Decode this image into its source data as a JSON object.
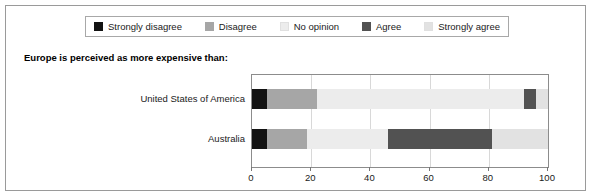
{
  "chart_data": {
    "type": "bar",
    "orientation": "horizontal",
    "stacked": true,
    "title": "Europe is perceived as more expensive than:",
    "xlabel": "",
    "ylabel": "",
    "xlim": [
      0,
      100
    ],
    "xticks": [
      0,
      20,
      40,
      60,
      80,
      100
    ],
    "grid": true,
    "legend_position": "top",
    "categories": [
      "United States of America",
      "Australia"
    ],
    "series": [
      {
        "name": "Strongly disagree",
        "color": "#121212",
        "values": [
          5,
          5
        ]
      },
      {
        "name": "Disagree",
        "color": "#a6a6a6",
        "values": [
          17,
          13.5
        ]
      },
      {
        "name": "No opinion",
        "color": "#ececec",
        "values": [
          70,
          27.5
        ]
      },
      {
        "name": "Agree",
        "color": "#525252",
        "values": [
          4,
          35
        ]
      },
      {
        "name": "Strongly agree",
        "color": "#e2e2e2",
        "values": [
          4,
          19
        ]
      }
    ]
  },
  "legend": {
    "items": [
      {
        "label": "Strongly disagree"
      },
      {
        "label": "Disagree"
      },
      {
        "label": "No opinion"
      },
      {
        "label": "Agree"
      },
      {
        "label": "Strongly agree"
      }
    ]
  },
  "axis": {
    "ticks": [
      {
        "label": "0",
        "value": 0
      },
      {
        "label": "20",
        "value": 20
      },
      {
        "label": "40",
        "value": 40
      },
      {
        "label": "60",
        "value": 60
      },
      {
        "label": "80",
        "value": 80
      },
      {
        "label": "100",
        "value": 100
      }
    ]
  }
}
